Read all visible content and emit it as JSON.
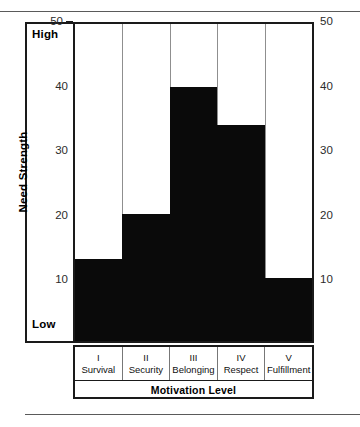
{
  "chart_data": {
    "type": "bar",
    "title": "",
    "xlabel": "Motivation Level",
    "ylabel": "Need Strength",
    "ylim": [
      0,
      50
    ],
    "yticks": [
      10,
      20,
      30,
      40,
      50
    ],
    "ytick_labels": [
      "10",
      "20",
      "30",
      "40",
      "50"
    ],
    "y_axis_low_label": "Low",
    "y_axis_high_label": "High",
    "grid": true,
    "legend": "none",
    "dual_y_axis": true,
    "categories": [
      "I\nSurvival",
      "II\nSecurity",
      "III\nBelonging",
      "IV\nRespect",
      "V\nFulfillment"
    ],
    "category_numerals": [
      "I",
      "II",
      "III",
      "IV",
      "V"
    ],
    "category_names": [
      "Survival",
      "Security",
      "Belonging",
      "Respect",
      "Fulfillment"
    ],
    "values": [
      13,
      20,
      40,
      34,
      10
    ],
    "bar_color": "#0a0a0a",
    "axis_color": "#1a1a1a",
    "grid_color": "#8f8f8f",
    "background": "#ffffff"
  },
  "axis": {
    "left_title": "Need Strength",
    "high_label": "High",
    "low_label": "Low",
    "left_ticks": [
      "50",
      "40",
      "30",
      "20",
      "10"
    ],
    "right_ticks": [
      "50",
      "40",
      "30",
      "20",
      "10"
    ]
  },
  "footer": {
    "x_axis_title": "Motivation Level"
  }
}
